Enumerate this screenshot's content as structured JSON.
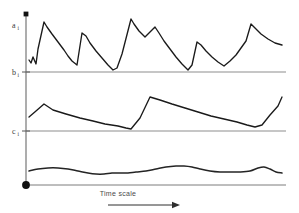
{
  "figure": {
    "title": "",
    "background_color": "#ffffff",
    "width": 299,
    "height": 213
  },
  "axis": {
    "vertical_axis_name": "vertical-axis",
    "origin_marker": "origin-dot",
    "top_marker": "axis-top-cap",
    "labels": [
      {
        "id": "a",
        "text": "a",
        "subscript": "i",
        "y": 26
      },
      {
        "id": "b",
        "text": "b",
        "subscript": "i",
        "y": 72
      },
      {
        "id": "c",
        "text": "c",
        "subscript": "i",
        "y": 131
      }
    ]
  },
  "annotation": {
    "time_scale_label": "Time scale",
    "arrow_name": "time-scale-arrow"
  },
  "colors": {
    "series_stroke": "#1a1a1a",
    "gridline": "#8d8d8d",
    "axis": "#8a8a8a",
    "text": "#3a3a3a"
  },
  "chart_data": {
    "type": "line",
    "title": "",
    "xlabel": "Time scale",
    "ylabel": "",
    "grid": true,
    "legend_position": "none",
    "axis_baselines": [
      {
        "label": "a",
        "pixel_y": 26,
        "note": "top series upper reference"
      },
      {
        "label": "b",
        "pixel_y": 72,
        "note": "baseline of top series / top of middle band"
      },
      {
        "label": "c",
        "pixel_y": 131,
        "note": "baseline of middle series / top of bottom band"
      },
      {
        "label": "origin",
        "pixel_y": 185,
        "note": "bottom axis"
      }
    ],
    "series": [
      {
        "name": "a",
        "shape": "sawtooth",
        "description": "Sharp rises followed by gradual exponential-like decays, seven cycles, riding above baseline b.",
        "points": [
          [
            29,
            60
          ],
          [
            31,
            63
          ],
          [
            33,
            57
          ],
          [
            36,
            64
          ],
          [
            38,
            49
          ],
          [
            44,
            22
          ],
          [
            47,
            27
          ],
          [
            52,
            34
          ],
          [
            58,
            42
          ],
          [
            64,
            50
          ],
          [
            68,
            56
          ],
          [
            72,
            61
          ],
          [
            77,
            65
          ],
          [
            82,
            33
          ],
          [
            86,
            36
          ],
          [
            90,
            43
          ],
          [
            96,
            51
          ],
          [
            102,
            58
          ],
          [
            108,
            65
          ],
          [
            113,
            70
          ],
          [
            117,
            68
          ],
          [
            122,
            54
          ],
          [
            131,
            19
          ],
          [
            134,
            24
          ],
          [
            139,
            31
          ],
          [
            145,
            37
          ],
          [
            150,
            32
          ],
          [
            155,
            27
          ],
          [
            159,
            33
          ],
          [
            164,
            41
          ],
          [
            170,
            49
          ],
          [
            176,
            57
          ],
          [
            182,
            64
          ],
          [
            188,
            70
          ],
          [
            192,
            65
          ],
          [
            197,
            42
          ],
          [
            201,
            45
          ],
          [
            206,
            51
          ],
          [
            212,
            57
          ],
          [
            218,
            62
          ],
          [
            224,
            66
          ],
          [
            230,
            61
          ],
          [
            236,
            55
          ],
          [
            241,
            48
          ],
          [
            246,
            41
          ],
          [
            251,
            24
          ],
          [
            255,
            28
          ],
          [
            261,
            34
          ],
          [
            268,
            39
          ],
          [
            275,
            43
          ],
          [
            282,
            45
          ]
        ]
      },
      {
        "name": "b",
        "shape": "piecewise-linear",
        "description": "Slow drifting trend with two abrupt upward jumps, riding between gridlines b and c.",
        "points": [
          [
            29,
            117
          ],
          [
            36,
            111
          ],
          [
            44,
            104
          ],
          [
            53,
            110
          ],
          [
            66,
            114
          ],
          [
            80,
            118
          ],
          [
            93,
            121
          ],
          [
            105,
            124
          ],
          [
            118,
            126
          ],
          [
            126,
            128
          ],
          [
            131,
            129
          ],
          [
            140,
            118
          ],
          [
            150,
            97
          ],
          [
            160,
            100
          ],
          [
            172,
            104
          ],
          [
            185,
            108
          ],
          [
            198,
            112
          ],
          [
            211,
            116
          ],
          [
            224,
            119
          ],
          [
            237,
            122
          ],
          [
            247,
            125
          ],
          [
            255,
            127
          ],
          [
            262,
            125
          ],
          [
            270,
            115
          ],
          [
            278,
            106
          ],
          [
            282,
            97
          ]
        ]
      },
      {
        "name": "c",
        "shape": "smooth-wave",
        "description": "Low-amplitude smooth undulating curve just above the bottom axis.",
        "points": [
          [
            29,
            171
          ],
          [
            38,
            169
          ],
          [
            48,
            168
          ],
          [
            58,
            168
          ],
          [
            68,
            169
          ],
          [
            78,
            171
          ],
          [
            88,
            173
          ],
          [
            96,
            174
          ],
          [
            104,
            174
          ],
          [
            112,
            173
          ],
          [
            120,
            173
          ],
          [
            128,
            173
          ],
          [
            136,
            172
          ],
          [
            146,
            171
          ],
          [
            156,
            169
          ],
          [
            166,
            167
          ],
          [
            176,
            166
          ],
          [
            184,
            166
          ],
          [
            192,
            167
          ],
          [
            200,
            169
          ],
          [
            210,
            171
          ],
          [
            220,
            172
          ],
          [
            230,
            172
          ],
          [
            240,
            172
          ],
          [
            250,
            171
          ],
          [
            258,
            168
          ],
          [
            264,
            167
          ],
          [
            270,
            169
          ],
          [
            276,
            172
          ],
          [
            282,
            173
          ]
        ]
      }
    ]
  }
}
